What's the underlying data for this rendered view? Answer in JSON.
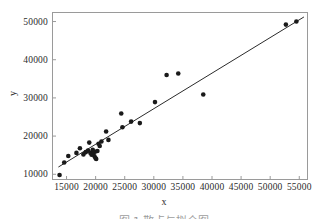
{
  "figure": {
    "background": "#ffffff",
    "frame_color": "#9a9a9a",
    "marker_color": "#1a1a1a",
    "line_color": "#2b2b2b"
  },
  "axis": {
    "xlabel": "x",
    "ylabel": "y",
    "x_ticks": [
      "15000",
      "20000",
      "25000",
      "30000",
      "35000",
      "40000",
      "45000",
      "50000",
      "55000"
    ],
    "y_ticks": [
      "10000",
      "20000",
      "30000",
      "40000",
      "50000"
    ]
  },
  "caption": {
    "text": "图 1  散点与拟合图"
  },
  "chart_data": {
    "type": "scatter",
    "title": "",
    "xlabel": "x",
    "ylabel": "y",
    "xlim": [
      12500,
      56500
    ],
    "ylim": [
      8500,
      52500
    ],
    "xticks": [
      15000,
      20000,
      25000,
      30000,
      35000,
      40000,
      45000,
      50000,
      55000
    ],
    "yticks": [
      10000,
      20000,
      30000,
      40000,
      50000
    ],
    "grid": false,
    "legend": false,
    "points": [
      [
        13800,
        9800
      ],
      [
        14600,
        13100
      ],
      [
        15300,
        14800
      ],
      [
        16700,
        15600
      ],
      [
        17300,
        16800
      ],
      [
        17900,
        15200
      ],
      [
        18300,
        15800
      ],
      [
        18700,
        16200
      ],
      [
        18900,
        18300
      ],
      [
        19100,
        15600
      ],
      [
        19300,
        15100
      ],
      [
        19500,
        16400
      ],
      [
        19600,
        15300
      ],
      [
        19800,
        14700
      ],
      [
        19900,
        15900
      ],
      [
        20000,
        14200
      ],
      [
        20100,
        14000
      ],
      [
        20300,
        16100
      ],
      [
        20500,
        18000
      ],
      [
        20700,
        17400
      ],
      [
        21000,
        18600
      ],
      [
        21800,
        21200
      ],
      [
        22200,
        19000
      ],
      [
        24400,
        25900
      ],
      [
        24600,
        22300
      ],
      [
        26100,
        23800
      ],
      [
        27600,
        23400
      ],
      [
        30200,
        28900
      ],
      [
        32200,
        36000
      ],
      [
        34200,
        36400
      ],
      [
        38500,
        30900
      ],
      [
        52700,
        49200
      ],
      [
        54500,
        50000
      ]
    ],
    "fit_line": {
      "type": "linear",
      "endpoints": [
        [
          13600,
          11900
        ],
        [
          55800,
          51200
        ]
      ]
    }
  }
}
